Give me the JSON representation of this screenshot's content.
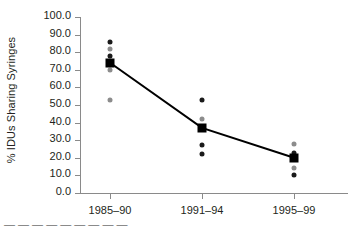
{
  "chart_data": {
    "type": "scatter",
    "title": "",
    "xlabel": "",
    "ylabel": "% IDUs Sharing Syringes",
    "categories": [
      "1985–90",
      "1991–94",
      "1995–99"
    ],
    "ylim": [
      0.0,
      100.0
    ],
    "ytick_labels": [
      "0.0",
      "10.0",
      "20.0",
      "30.0",
      "40.0",
      "50.0",
      "60.0",
      "70.0",
      "80.0",
      "90.0",
      "100.0"
    ],
    "ytick_values": [
      0,
      10,
      20,
      30,
      40,
      50,
      60,
      70,
      80,
      90,
      100
    ],
    "grid": false,
    "legend": "none",
    "series": [
      {
        "name": "Mean",
        "marker": "filled-square",
        "color": "#000000",
        "values": [
          74.0,
          37.0,
          20.0
        ]
      }
    ],
    "observations": [
      {
        "category": "1985–90",
        "points": [
          {
            "value": 86.0,
            "shade": "dark"
          },
          {
            "value": 82.0,
            "shade": "gray"
          },
          {
            "value": 78.0,
            "shade": "dark"
          },
          {
            "value": 70.0,
            "shade": "gray"
          },
          {
            "value": 53.0,
            "shade": "gray"
          }
        ]
      },
      {
        "category": "1991–94",
        "points": [
          {
            "value": 53.0,
            "shade": "dark"
          },
          {
            "value": 42.0,
            "shade": "gray"
          },
          {
            "value": 27.0,
            "shade": "dark"
          },
          {
            "value": 22.0,
            "shade": "dark"
          }
        ]
      },
      {
        "category": "1995–99",
        "points": [
          {
            "value": 28.0,
            "shade": "gray"
          },
          {
            "value": 23.0,
            "shade": "dark"
          },
          {
            "value": 14.0,
            "shade": "gray"
          },
          {
            "value": 10.0,
            "shade": "dark"
          }
        ]
      }
    ],
    "trend_line": {
      "color": "#000000",
      "values": [
        74.0,
        37.0,
        20.0
      ]
    }
  },
  "caption": {
    "clipped_text": "—  —   —  —  —      —   —  —   —"
  }
}
